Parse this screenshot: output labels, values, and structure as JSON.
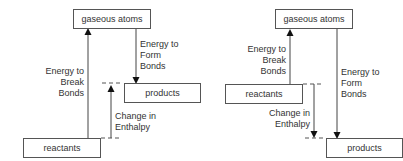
{
  "diagrams": [
    {
      "id": "exothermic",
      "boxes": {
        "top": "gaseous atoms",
        "mid": "products",
        "bottom": "reactants"
      },
      "labels": {
        "break": [
          "Energy to",
          "Break",
          "Bonds"
        ],
        "form": [
          "Energy to",
          "Form",
          "Bonds"
        ],
        "enthalpy": [
          "Change in",
          "Enthalpy"
        ]
      }
    },
    {
      "id": "endothermic",
      "boxes": {
        "top": "gaseous atoms",
        "mid": "reactants",
        "bottom": "products"
      },
      "labels": {
        "break": [
          "Energy to",
          "Break",
          "Bonds"
        ],
        "form": [
          "Energy to",
          "Form",
          "Bonds"
        ],
        "enthalpy": [
          "Change in",
          "Enthalpy"
        ]
      }
    }
  ],
  "colors": {
    "line": "#333333",
    "box_border": "#555555",
    "text": "#333333"
  }
}
